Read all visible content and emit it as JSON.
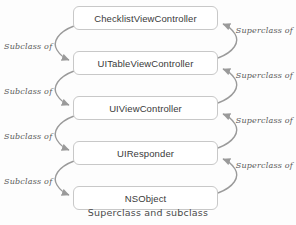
{
  "diagram": {
    "title": "Superclass and subclass",
    "caption": "Superclass and subclass",
    "type": "class-hierarchy",
    "colors": {
      "background": "#fdfdfd",
      "box_fill": "#ffffff",
      "box_border": "#c8c8c8",
      "box_text": "#3a3a3a",
      "arrow": "#9a9a9a",
      "label_text": "#5a5a5a",
      "caption_text": "#4a4a4a"
    },
    "boxes": [
      {
        "label": "ChecklistViewController",
        "level": 0
      },
      {
        "label": "UITableViewController",
        "level": 1
      },
      {
        "label": "UIViewController",
        "level": 2
      },
      {
        "label": "UIResponder",
        "level": 3
      },
      {
        "label": "NSObject",
        "level": 4
      }
    ],
    "left_labels": [
      {
        "text": "Subclass of"
      },
      {
        "text": "Subclass of"
      },
      {
        "text": "Subclass of"
      },
      {
        "text": "Subclass of"
      }
    ],
    "right_labels": [
      {
        "text": "Superclass of"
      },
      {
        "text": "Superclass of"
      },
      {
        "text": "Superclass of"
      },
      {
        "text": "Superclass of"
      }
    ]
  }
}
